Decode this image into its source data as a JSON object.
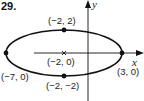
{
  "problem": {
    "number": "29."
  },
  "axes": {
    "x_label": "x",
    "y_label": "y"
  },
  "ellipse": {
    "center": {
      "label": "(−2, 0)",
      "x": -2,
      "y": 0,
      "marker": "x"
    },
    "vertices": [
      {
        "label": "(−7, 0)",
        "x": -7,
        "y": 0
      },
      {
        "label": "(3, 0)",
        "x": 3,
        "y": 0
      }
    ],
    "co_vertices": [
      {
        "label": "(−2, 2)",
        "x": -2,
        "y": 2
      },
      {
        "label": "(−2, −2)",
        "x": -2,
        "y": -2
      }
    ]
  },
  "colors": {
    "stroke": "#111111",
    "background": "#ffffff"
  }
}
